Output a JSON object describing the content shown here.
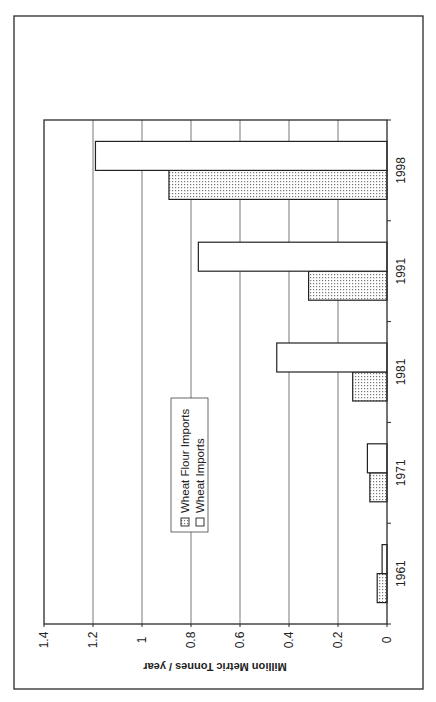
{
  "chart_data": {
    "type": "bar",
    "orientation": "rotated-90-clockwise",
    "title": "",
    "xlabel": "",
    "ylabel": "Million Metric Tonnes / year",
    "ylim": [
      0,
      1.4
    ],
    "yticks": [
      "0",
      "0.2",
      "0.4",
      "0.6",
      "0.8",
      "1",
      "1.2",
      "1.4"
    ],
    "ytick_values": [
      0,
      0.2,
      0.4,
      0.6,
      0.8,
      1.0,
      1.2,
      1.4
    ],
    "grid": true,
    "categories": [
      "1961",
      "1971",
      "1981",
      "1991",
      "1998"
    ],
    "series": [
      {
        "name": "Wheat Flour Imports",
        "pattern": "dotted",
        "values": [
          0.04,
          0.07,
          0.14,
          0.32,
          0.89
        ]
      },
      {
        "name": "Wheat Imports",
        "pattern": "white",
        "values": [
          0.02,
          0.08,
          0.45,
          0.77,
          1.19
        ]
      }
    ],
    "legend": {
      "position": "inside-upper-left",
      "entries": [
        "Wheat Flour Imports",
        "Wheat Imports"
      ]
    }
  },
  "colors": {
    "frame": "#2a2a2a",
    "grid": "#555555",
    "bar_stroke": "#222222",
    "bar_fill_white": "#ffffff",
    "dot_color": "#777777"
  }
}
